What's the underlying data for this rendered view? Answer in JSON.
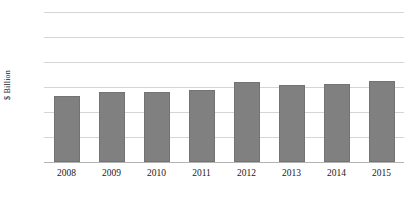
{
  "chart_data": {
    "type": "bar",
    "title": "",
    "xlabel": "",
    "ylabel": "$ Billion",
    "categories": [
      "2008",
      "2009",
      "2010",
      "2011",
      "2012",
      "2013",
      "2014",
      "2015"
    ],
    "values": [
      13.3,
      14.0,
      14.0,
      14.4,
      16.1,
      15.4,
      15.6,
      16.3
    ],
    "ylim": [
      0,
      30
    ],
    "ytick_labels": [
      "30",
      "25",
      "20",
      "15",
      "10",
      "5",
      "0"
    ],
    "ytick_values": [
      30,
      25,
      20,
      15,
      10,
      5,
      0
    ],
    "grid": true,
    "legend": null,
    "series_color": "#808080",
    "gridline_color": "#d5d5d5"
  }
}
